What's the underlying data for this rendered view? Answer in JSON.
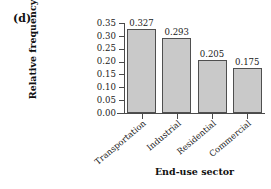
{
  "panel": {
    "label": "(d)"
  },
  "chart_data": {
    "type": "bar",
    "title": "",
    "xlabel": "End-use sector",
    "ylabel": "Relative frequency",
    "categories": [
      "Transportation",
      "Industrial",
      "Residential",
      "Commercial"
    ],
    "values": [
      0.327,
      0.293,
      0.205,
      0.175
    ],
    "value_labels": [
      "0.327",
      "0.293",
      "0.205",
      "0.175"
    ],
    "ylim": [
      0.0,
      0.35
    ],
    "ytick_values": [
      0.0,
      0.05,
      0.1,
      0.15,
      0.2,
      0.25,
      0.3,
      0.35
    ],
    "ytick_labels": [
      "0.00",
      "0.05",
      "0.10",
      "0.15",
      "0.20",
      "0.25",
      "0.30",
      "0.35"
    ],
    "grid": false,
    "legend": false,
    "legend_position": "none",
    "bar_color": "#c9c9c9",
    "bar_edge_color": "#4f4f4f",
    "axis_color": "#4a4a4a",
    "background_color": "#ffffff",
    "xtick_label_rotation": -40
  }
}
